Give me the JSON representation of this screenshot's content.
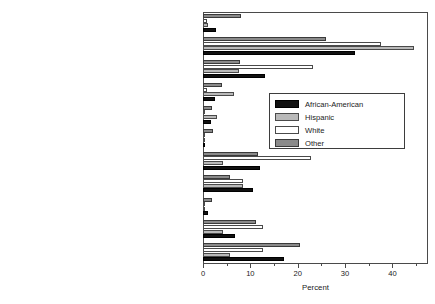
{
  "chart_data": {
    "type": "bar",
    "orientation": "horizontal",
    "title": "",
    "xlabel": "Percent",
    "ylabel": "",
    "xlim": [
      0,
      47.5
    ],
    "xticks": [
      0,
      10,
      20,
      30,
      40
    ],
    "xtick_labels": [
      "0",
      "10",
      "20",
      "30",
      "40"
    ],
    "grid": false,
    "legend_position": "center-right",
    "categories": [
      "Test Scores",
      "Teacher quality",
      "Parental involvement/cooperation",
      "Morals/Values",
      "Facilities",
      "Diversity of students",
      "Discipline/Safety",
      "Class or school size",
      "After school programs/extracurricular activities",
      "Administrators/Principal/Staff",
      "Academic environment/curriculum"
    ],
    "series": [
      {
        "name": "African-American",
        "color": "#111111",
        "values": [
          2.8,
          32.0,
          13.0,
          2.6,
          1.6,
          0.3,
          12.0,
          10.6,
          1.1,
          6.8,
          17.0
        ]
      },
      {
        "name": "Hispanic",
        "color": "#b9b9b9",
        "values": [
          1.0,
          44.5,
          7.6,
          6.6,
          2.9,
          0.1,
          4.2,
          8.4,
          0.3,
          4.2,
          5.6
        ]
      },
      {
        "name": "White",
        "color": "#ffffff",
        "values": [
          0.8,
          37.6,
          23.3,
          0.8,
          0.3,
          0.1,
          22.9,
          8.4,
          0.2,
          12.6,
          12.6
        ]
      },
      {
        "name": "Other",
        "color": "#8a8a8a",
        "values": [
          8.0,
          26.0,
          7.8,
          4.0,
          2.0,
          2.1,
          11.6,
          5.7,
          2.0,
          11.2,
          20.5
        ]
      }
    ]
  },
  "legend": {
    "entries": [
      {
        "label": "African-American"
      },
      {
        "label": "Hispanic"
      },
      {
        "label": "White"
      },
      {
        "label": "Other"
      }
    ]
  },
  "axis": {
    "x_title": "Percent"
  }
}
